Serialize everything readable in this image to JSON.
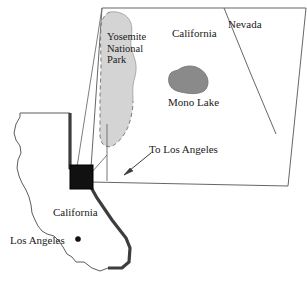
{
  "figure": {
    "kind": "locator-map",
    "width": 307,
    "height": 284
  },
  "colors": {
    "background": "#ffffff",
    "outline": "#3a3a3a",
    "text": "#1a1a1a",
    "park_fill": "#d4d4d4",
    "park_outline": "#8c8c8c",
    "lake_fill": "#8a8a8a",
    "lake_outline": "#6a6a6a",
    "state_border_thick": "#4a4a4a",
    "detail_box_fill": "#111111",
    "inset_frame": "#555555",
    "leader_line": "#666666"
  },
  "inset": {
    "name": "eastern-sierra-detail-inset",
    "frame_shape": "trapezoid",
    "labels": {
      "yosemite_line1": "Yosemite",
      "yosemite_line2": "National",
      "yosemite_line3": "Park",
      "california": "California",
      "nevada": "Nevada",
      "mono_lake": "Mono Lake",
      "to_los_angeles": "To Los Angeles"
    },
    "features": [
      {
        "name": "yosemite-national-park",
        "type": "park-polygon",
        "fill": "#d4d4d4",
        "border": "dashed"
      },
      {
        "name": "mono-lake",
        "type": "lake-polygon",
        "fill": "#8a8a8a"
      },
      {
        "name": "california-nevada-border",
        "type": "border-line"
      },
      {
        "name": "to-los-angeles-arrow",
        "type": "arrow",
        "direction": "down-left"
      }
    ]
  },
  "overview": {
    "name": "california-state-overview",
    "labels": {
      "california": "California",
      "los_angeles": "Los Angeles"
    },
    "markers": [
      {
        "name": "los-angeles-dot",
        "type": "city-point"
      },
      {
        "name": "detail-area-box",
        "type": "highlight-square"
      }
    ]
  }
}
